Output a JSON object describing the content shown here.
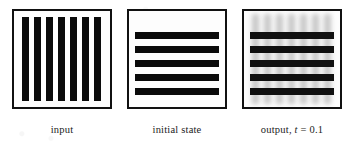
{
  "figure": {
    "background_color": "#ffffff",
    "ink_color": "#0a0a0a",
    "ghost_color": "#9a9a9a"
  },
  "panels": [
    {
      "id": "input",
      "caption": "input",
      "pattern": "vertical-bars",
      "bar_count": 7,
      "bar_color": "#0a0a0a",
      "bar_width_px": 7,
      "bar_positions_px": [
        8,
        20,
        32,
        44,
        56,
        68,
        80
      ],
      "blurred": false
    },
    {
      "id": "initial-state",
      "caption": "initial state",
      "pattern": "horizontal-bars",
      "bar_count": 5,
      "bar_color": "#0a0a0a",
      "bar_height_px": 7,
      "bar_positions_px": [
        21,
        35,
        49,
        63,
        77
      ],
      "blurred": false
    },
    {
      "id": "output",
      "caption_prefix": "output, ",
      "caption_variable": "t",
      "caption_suffix": " = 0.1",
      "caption_full": "output, t = 0.1",
      "pattern": "horizontal-bars-with-blurred-vertical-ghosts",
      "bar_count": 5,
      "bar_color": "#0a0a0a",
      "bar_height_px": 7,
      "bar_positions_px": [
        21,
        35,
        49,
        63,
        77
      ],
      "ghost_bar_count": 7,
      "ghost_bar_color": "#9a9a9a",
      "ghost_positions_px": [
        8,
        20,
        32,
        44,
        56,
        68,
        80
      ],
      "blurred": true,
      "time_value": "0.1"
    }
  ]
}
